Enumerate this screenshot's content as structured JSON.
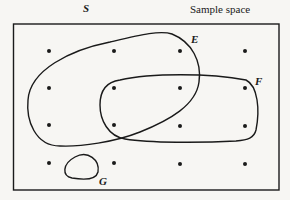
{
  "diagram": {
    "type": "venn",
    "sample_space_symbol": "S",
    "sample_space_label": "Sample space",
    "events": [
      {
        "name": "E",
        "label": "E"
      },
      {
        "name": "F",
        "label": "F"
      },
      {
        "name": "G",
        "label": "G"
      }
    ],
    "grid_points": {
      "rows": 4,
      "cols": 4,
      "count": 16
    },
    "colors": {
      "ink": "#1a1a1a",
      "paper": "#f7f6f3"
    }
  }
}
